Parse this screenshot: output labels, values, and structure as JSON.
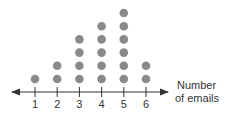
{
  "chart_data": {
    "type": "scatter",
    "subtype": "dot-plot",
    "title": "",
    "xlabel": "Number of emails",
    "xlabel_lines": [
      "Number",
      "of emails"
    ],
    "ylabel": "",
    "categories": [
      1,
      2,
      3,
      4,
      5,
      6
    ],
    "values": [
      1,
      2,
      4,
      5,
      6,
      2
    ],
    "xlim": [
      0.5,
      6.5
    ],
    "grid": false,
    "legend": "none",
    "dot_color": "#8a8a8a",
    "axis_color": "#333333"
  }
}
